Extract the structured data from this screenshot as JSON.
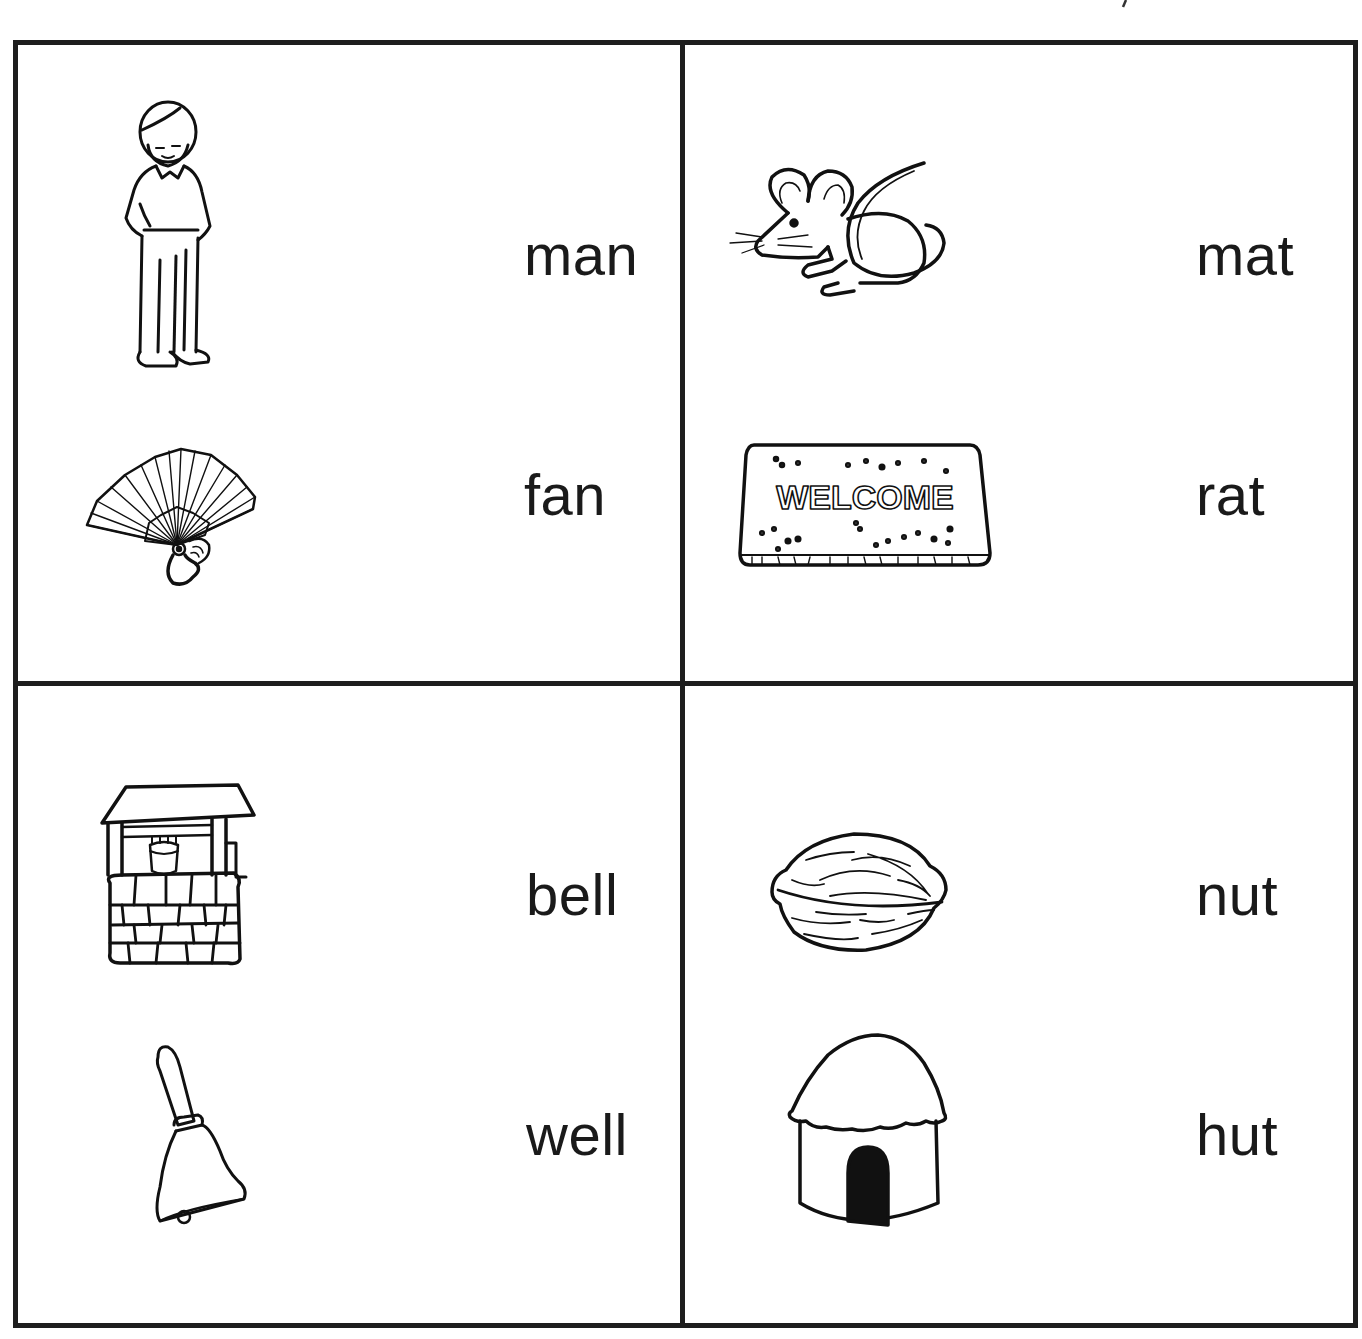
{
  "worksheet": {
    "title": "",
    "quadrants": [
      {
        "id": "top-left",
        "pictures": [
          {
            "name": "man",
            "icon": "man-icon"
          },
          {
            "name": "fan",
            "icon": "fan-icon"
          }
        ],
        "words": [
          "man",
          "fan"
        ]
      },
      {
        "id": "top-right",
        "pictures": [
          {
            "name": "rat",
            "icon": "rat-icon"
          },
          {
            "name": "mat",
            "icon": "welcome-mat-icon",
            "label": "WELCOME"
          }
        ],
        "words": [
          "mat",
          "rat"
        ]
      },
      {
        "id": "bottom-left",
        "pictures": [
          {
            "name": "well",
            "icon": "well-icon"
          },
          {
            "name": "bell",
            "icon": "bell-icon"
          }
        ],
        "words": [
          "bell",
          "well"
        ]
      },
      {
        "id": "bottom-right",
        "pictures": [
          {
            "name": "nut",
            "icon": "nut-icon"
          },
          {
            "name": "hut",
            "icon": "hut-icon"
          }
        ],
        "words": [
          "nut",
          "hut"
        ]
      }
    ]
  },
  "colors": {
    "line": "#1e1e1e",
    "text": "#1a1a1a",
    "background": "#ffffff"
  }
}
